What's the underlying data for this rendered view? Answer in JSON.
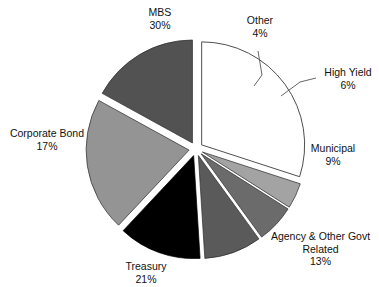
{
  "chart_data": {
    "type": "pie",
    "title": "",
    "subtitle": "",
    "xlabel": "",
    "ylabel": "",
    "legend_position": "none",
    "grid": false,
    "labels_show_percent": true,
    "exploded": true,
    "categories": [
      "MBS",
      "Other",
      "High Yield",
      "Municipal",
      "Agency & Other Govt Related",
      "Treasury",
      "Corporate Bond"
    ],
    "values": [
      30,
      4,
      6,
      9,
      13,
      21,
      17
    ],
    "value_unit": "%",
    "colors": [
      "#ffffff",
      "#a3a3a3",
      "#6b6b6b",
      "#5a5a5a",
      "#000000",
      "#949494",
      "#525252"
    ],
    "slices": [
      {
        "name": "MBS",
        "value": 30,
        "value_label": "30%",
        "color": "#ffffff",
        "stroke": "#3a3a3a",
        "start_angle": 0,
        "end_angle": 108,
        "leader_line": false
      },
      {
        "name": "Other",
        "value": 4,
        "value_label": "4%",
        "color": "#a3a3a3",
        "stroke": "#2a2a2a",
        "start_angle": 108,
        "end_angle": 122.4,
        "leader_line": true
      },
      {
        "name": "High Yield",
        "value": 6,
        "value_label": "6%",
        "color": "#6b6b6b",
        "stroke": "#2a2a2a",
        "start_angle": 122.4,
        "end_angle": 144,
        "leader_line": true
      },
      {
        "name": "Municipal",
        "value": 9,
        "value_label": "9%",
        "color": "#5a5a5a",
        "stroke": "#2a2a2a",
        "start_angle": 144,
        "end_angle": 176.4,
        "leader_line": false
      },
      {
        "name": "Agency & Other Govt Related",
        "name_line1": "Agency & Other Govt",
        "name_line2": "Related",
        "value": 13,
        "value_label": "13%",
        "color": "#000000",
        "stroke": "#000000",
        "start_angle": 176.4,
        "end_angle": 223.2,
        "leader_line": false
      },
      {
        "name": "Treasury",
        "value": 21,
        "value_label": "21%",
        "color": "#949494",
        "stroke": "#2a2a2a",
        "start_angle": 223.2,
        "end_angle": 298.8,
        "leader_line": false
      },
      {
        "name": "Corporate Bond",
        "value": 17,
        "value_label": "17%",
        "color": "#525252",
        "stroke": "#2a2a2a",
        "start_angle": 298.8,
        "end_angle": 360,
        "leader_line": false
      }
    ]
  },
  "labels": {
    "mbs": {
      "name": "MBS",
      "value": "30%"
    },
    "other": {
      "name": "Other",
      "value": "4%"
    },
    "high_yield": {
      "name": "High Yield",
      "value": "6%"
    },
    "municipal": {
      "name": "Municipal",
      "value": "9%"
    },
    "agency": {
      "name_line1": "Agency & Other Govt",
      "name_line2": "Related",
      "value": "13%"
    },
    "treasury": {
      "name": "Treasury",
      "value": "21%"
    },
    "corporate_bond": {
      "name": "Corporate Bond",
      "value": "17%"
    }
  }
}
